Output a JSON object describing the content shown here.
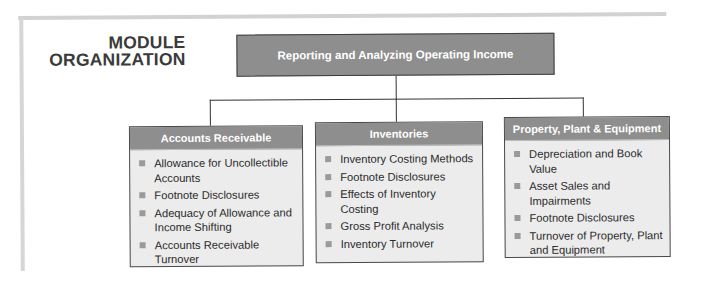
{
  "title": {
    "line1": "MODULE",
    "line2": "ORGANIZATION"
  },
  "root": {
    "label": "Reporting and Analyzing Operating Income"
  },
  "colors": {
    "box_fill": "#8e8e8e",
    "box_body": "#ececec",
    "border": "#3d3d3d",
    "bullet": "#9a9a9a",
    "frame": "#d2d2d2"
  },
  "children": [
    {
      "header": "Accounts Receivable",
      "items": [
        "Allowance for Uncollectible Accounts",
        "Footnote Disclosures",
        "Adequacy of Allowance and Income Shifting",
        "Accounts Receivable Turnover"
      ]
    },
    {
      "header": "Inventories",
      "items": [
        "Inventory Costing Methods",
        "Footnote Disclosures",
        "Effects of Inventory Costing",
        "Gross Profit Analysis",
        "Inventory Turnover"
      ]
    },
    {
      "header": "Property, Plant & Equipment",
      "items": [
        "Depreciation and Book Value",
        "Asset Sales and Impairments",
        "Footnote Disclosures",
        "Turnover of Property, Plant and Equipment"
      ]
    }
  ]
}
